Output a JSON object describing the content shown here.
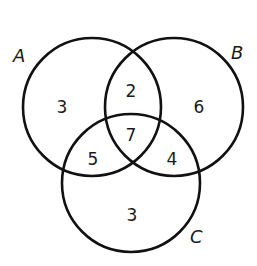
{
  "diagram": {
    "type": "venn",
    "sets": [
      {
        "id": "A",
        "label": "A"
      },
      {
        "id": "B",
        "label": "B"
      },
      {
        "id": "C",
        "label": "C"
      }
    ],
    "regions": {
      "A_only": "3",
      "B_only": "6",
      "C_only": "3",
      "A_and_B_only": "2",
      "A_and_C_only": "5",
      "B_and_C_only": "4",
      "A_and_B_and_C": "7"
    },
    "colors": {
      "stroke": "#111111",
      "text": "#1a1a1a",
      "background": "#ffffff"
    }
  }
}
